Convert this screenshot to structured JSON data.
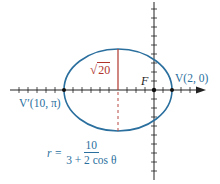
{
  "figure": {
    "type": "polar conic (ellipse) diagram",
    "colors": {
      "curve": "#2a6f9e",
      "minor_axis": "#b0342c",
      "axes": "#222222",
      "label_blue": "#2a6f9e",
      "label_red": "#b0342c"
    },
    "labels": {
      "vertex_right": "V(2, 0)",
      "vertex_left": "V′(10, π)",
      "focus": "F",
      "semi_minor": "20",
      "sqrt_symbol": "√"
    },
    "equation": {
      "lhs": "r =",
      "numerator": "10",
      "denominator": "3 + 2 cos θ"
    },
    "geometry": {
      "center": [
        118,
        90
      ],
      "rx": 54,
      "ry": 41,
      "focus": [
        154,
        90
      ],
      "vertex_right": [
        172,
        90
      ],
      "vertex_left": [
        64,
        90
      ]
    }
  }
}
